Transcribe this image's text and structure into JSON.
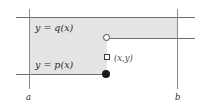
{
  "figure": {
    "type": "math-region-diagram",
    "background_color": "#ffffff",
    "shade_color": "#e4e4e4",
    "line_color": "#6f6f6f",
    "axis_color": "#8a8a8a",
    "text_color": "#2b2b2b",
    "labels": {
      "upper_curve": "y = q(x)",
      "lower_curve": "y = p(x)",
      "point": "(x,y)",
      "left_bound": "a",
      "right_bound": "b"
    },
    "markers": [
      {
        "name": "open-circle-upper",
        "symbol": "open-circle",
        "meaning": "y = q(x) value at x, excluded endpoint"
      },
      {
        "name": "square-point",
        "symbol": "open-square",
        "meaning": "the point (x,y)"
      },
      {
        "name": "filled-circle-lower",
        "symbol": "filled-circle",
        "meaning": "y = p(x) value at x, included endpoint"
      }
    ]
  }
}
